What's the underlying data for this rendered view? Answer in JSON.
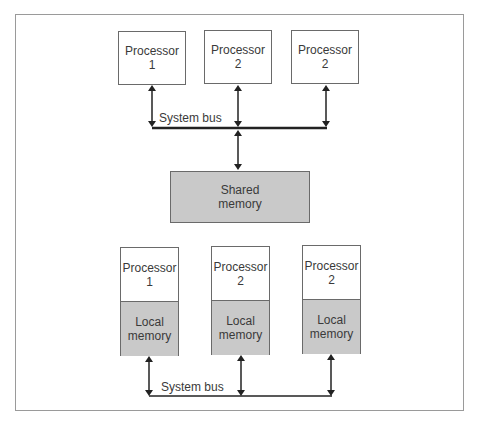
{
  "top_section": {
    "processors": [
      {
        "line1": "Processor",
        "line2": "1"
      },
      {
        "line1": "Processor",
        "line2": "2"
      },
      {
        "line1": "Processor",
        "line2": "2"
      }
    ],
    "bus_label": "System bus",
    "shared_memory": {
      "line1": "Shared",
      "line2": "memory"
    }
  },
  "bottom_section": {
    "nodes": [
      {
        "proc_line1": "Processor",
        "proc_line2": "1",
        "mem_line1": "Local",
        "mem_line2": "memory"
      },
      {
        "proc_line1": "Processor",
        "proc_line2": "2",
        "mem_line1": "Local",
        "mem_line2": "memory"
      },
      {
        "proc_line1": "Processor",
        "proc_line2": "2",
        "mem_line1": "Local",
        "mem_line2": "memory"
      }
    ],
    "bus_label": "System bus"
  },
  "colors": {
    "memory_fill": "#c9c9c9",
    "line": "#222222",
    "frame": "#9a9a9a"
  }
}
